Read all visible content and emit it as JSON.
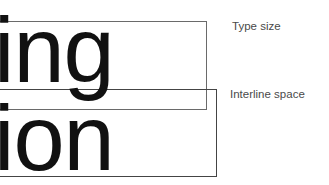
{
  "diagram": {
    "words": [
      {
        "text": "ing"
      },
      {
        "text": "ion"
      }
    ],
    "labels": {
      "type_size": "Type size",
      "interline_space": "Interline space"
    }
  }
}
